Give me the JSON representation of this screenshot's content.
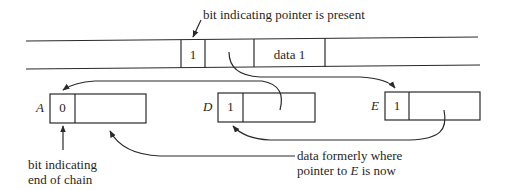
{
  "diagram": {
    "annotations": {
      "pointer_bit": "bit indicating pointer is present",
      "end_bit_line1": "bit indicating",
      "end_bit_line2": "end of chain",
      "moved_data_line1": "data formerly where",
      "moved_data_line2_prefix": "pointer to ",
      "moved_data_line2_var": "E",
      "moved_data_line2_suffix": " is now"
    },
    "top_record": {
      "bit": "1",
      "pointer": "",
      "data": "data 1"
    },
    "chain_records": [
      {
        "name": "A",
        "bit": "0",
        "data": ""
      },
      {
        "name": "D",
        "bit": "1",
        "data": ""
      },
      {
        "name": "E",
        "bit": "1",
        "data": ""
      }
    ],
    "colors": {
      "line": "#2a2a2a",
      "background": "#ffffff"
    }
  }
}
